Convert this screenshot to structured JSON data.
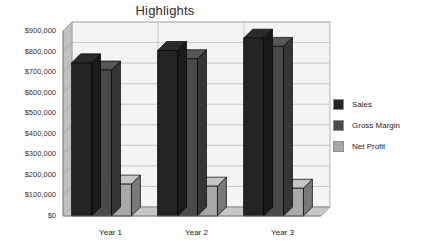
{
  "chart_data": {
    "type": "bar",
    "title": "Highlights",
    "xlabel": "",
    "ylabel": "",
    "categories": [
      "Year 1",
      "Year 2",
      "Year 3"
    ],
    "series": [
      {
        "name": "Sales",
        "values": [
          745000,
          805000,
          865000
        ],
        "color": "#242424"
      },
      {
        "name": "Gross Margin",
        "values": [
          710000,
          765000,
          825000
        ],
        "color": "#4a4a4a"
      },
      {
        "name": "Net Profit",
        "values": [
          155000,
          145000,
          135000
        ],
        "color": "#a8a8a8"
      }
    ],
    "ylim": [
      0,
      900000
    ],
    "ytick_values": [
      0,
      100000,
      200000,
      300000,
      400000,
      500000,
      600000,
      700000,
      800000,
      900000
    ],
    "ytick_labels": [
      "$0",
      "$100,000",
      "$200,000",
      "$300,000",
      "$400,000",
      "$500,000",
      "$600,000",
      "$700,000",
      "$800,000",
      "$900,000"
    ],
    "grid": true,
    "legend_position": "right",
    "style": "3d-column"
  },
  "legend": {
    "items": [
      {
        "label": "Sales",
        "color": "#242424"
      },
      {
        "label": "Gross Margin",
        "color": "#4a4a4a"
      },
      {
        "label": "Net Profit",
        "color": "#a8a8a8"
      }
    ]
  },
  "colors": {
    "background": "#ffffff",
    "wall": "#f4f4f4",
    "wall_side": "#c0c0c0",
    "floor": "#c6c6c6",
    "grid": "#b5b5b5",
    "axis": "#7a7a7a",
    "title_text": "#2e2e2e",
    "tick_text": "#333333"
  }
}
